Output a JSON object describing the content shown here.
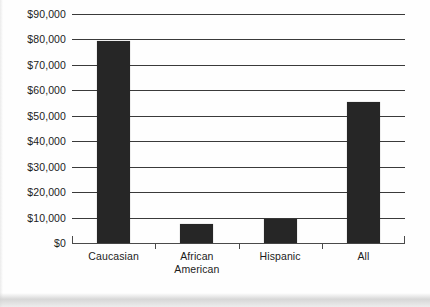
{
  "chart_data": {
    "type": "bar",
    "title": "",
    "subtitle": "",
    "xlabel": "",
    "ylabel": "",
    "categories": [
      "Caucasian",
      "African\nAmerican",
      "Hispanic",
      "All"
    ],
    "values": [
      79300,
      7300,
      9500,
      55500
    ],
    "ylim": [
      0,
      90000
    ],
    "ytick_values": [
      0,
      10000,
      20000,
      30000,
      40000,
      50000,
      60000,
      70000,
      80000,
      90000
    ],
    "ytick_labels": [
      "$0",
      "$10,000",
      "$20,000",
      "$30,000",
      "$40,000",
      "$50,000",
      "$60,000",
      "$70,000",
      "$80,000",
      "$90,000"
    ],
    "grid": true,
    "legend": false,
    "legend_position": "none",
    "bar_color": "#262626",
    "gridline_color": "#3a3a3a",
    "axis_color": "#4a4a4a",
    "background_color": "#fefefe",
    "text_color": "#1c1c1c"
  }
}
